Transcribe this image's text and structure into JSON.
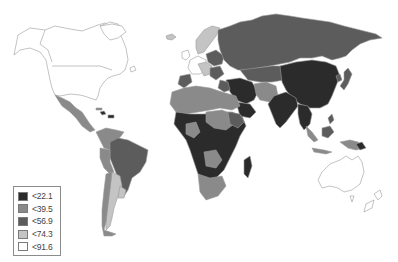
{
  "map": {
    "type": "choropleth",
    "projection": "world",
    "legend": {
      "position": "bottom-left",
      "entries": [
        {
          "label": "<22.1",
          "color": "#2b2b2b"
        },
        {
          "label": "<39.5",
          "color": "#8a8a8a"
        },
        {
          "label": "<56.9",
          "color": "#5c5c5c"
        },
        {
          "label": "<74.3",
          "color": "#c4c4c4"
        },
        {
          "label": "<91.6",
          "color": "#ffffff"
        }
      ]
    }
  }
}
